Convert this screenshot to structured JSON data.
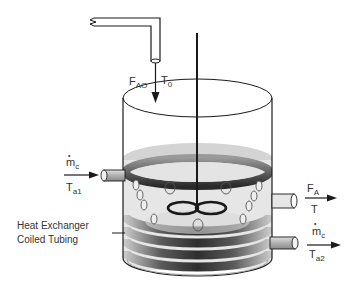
{
  "figure": {
    "labels": {
      "feed_flow": {
        "main": "F",
        "sub": "AO"
      },
      "feed_temp": {
        "main": "T",
        "sub": "0"
      },
      "coolant_in_flow": {
        "main": "m",
        "sub": "c",
        "dot": "•"
      },
      "coolant_in_temp": {
        "main": "T",
        "sub": "a1"
      },
      "outlet_flow": {
        "main": "F",
        "sub": "A"
      },
      "outlet_temp": {
        "main": "T",
        "sub": ""
      },
      "coolant_out_flow": {
        "main": "m",
        "sub": "c",
        "dot": "•"
      },
      "coolant_out_temp": {
        "main": "T",
        "sub": "a2"
      },
      "heat_exchanger_line1": "Heat Exchanger",
      "heat_exchanger_line2": "Coiled Tubing"
    },
    "colors": {
      "outline": "#1a1a1a",
      "liquid_light": "#e4e4e4",
      "liquid_top": "#cfcfcf",
      "coil_dark": "#3a3a3a",
      "coil_light": "#bdbdbd",
      "pipe_fill": "#b8b8b8"
    }
  }
}
